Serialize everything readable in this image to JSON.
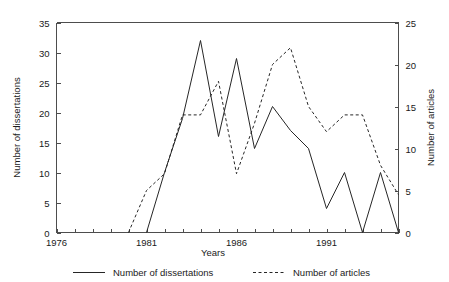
{
  "chart_data": {
    "type": "line",
    "title": "",
    "xlabel": "Years",
    "ylabel": "Number of dissertations",
    "y2label": "Number of articles",
    "xlim": [
      1976,
      1995
    ],
    "ylim": [
      0,
      35
    ],
    "y2lim": [
      0,
      25
    ],
    "grid": false,
    "legend_position": "below",
    "x_tick_labels": [
      "1976",
      "1981",
      "1986",
      "1991"
    ],
    "x_tick_values": [
      1976,
      1981,
      1986,
      1991
    ],
    "x_minor_ticks": [
      1976,
      1977,
      1978,
      1979,
      1980,
      1981,
      1982,
      1983,
      1984,
      1985,
      1986,
      1987,
      1988,
      1989,
      1990,
      1991,
      1992,
      1993,
      1994,
      1995
    ],
    "y_tick_labels": [
      "0",
      "5",
      "10",
      "15",
      "20",
      "25",
      "30",
      "35"
    ],
    "y_tick_values": [
      0,
      5,
      10,
      15,
      20,
      25,
      30,
      35
    ],
    "y2_tick_labels": [
      "0",
      "5",
      "10",
      "15",
      "20",
      "25"
    ],
    "y2_tick_values": [
      0,
      5,
      10,
      15,
      20,
      25
    ],
    "x": [
      1976,
      1977,
      1978,
      1979,
      1980,
      1981,
      1982,
      1983,
      1984,
      1985,
      1986,
      1987,
      1988,
      1989,
      1990,
      1991,
      1992,
      1993,
      1994,
      1995
    ],
    "series": [
      {
        "name": "Number of dissertations",
        "axis": "left",
        "style": "solid",
        "color": "#262626",
        "x": [
          1981,
          1982,
          1983,
          1984,
          1985,
          1986,
          1987,
          1988,
          1989,
          1990,
          1991,
          1992,
          1993,
          1994,
          1995
        ],
        "values": [
          0,
          10,
          19,
          32,
          16,
          29,
          14,
          21,
          17,
          14,
          4,
          10,
          0,
          10,
          0
        ]
      },
      {
        "name": "Number of articles",
        "axis": "right",
        "style": "dashed",
        "color": "#262626",
        "x": [
          1980,
          1981,
          1982,
          1983,
          1984,
          1985,
          1986,
          1987,
          1988,
          1989,
          1990,
          1991,
          1992,
          1993,
          1994,
          1995
        ],
        "values": [
          0,
          5,
          7,
          14,
          14,
          18,
          7,
          13,
          20,
          22,
          15,
          12,
          14,
          14,
          8,
          4.5
        ]
      }
    ]
  },
  "legend": {
    "items": [
      {
        "label": "Number of dissertations",
        "style": "solid"
      },
      {
        "label": "Number of articles",
        "style": "dashed"
      }
    ]
  }
}
